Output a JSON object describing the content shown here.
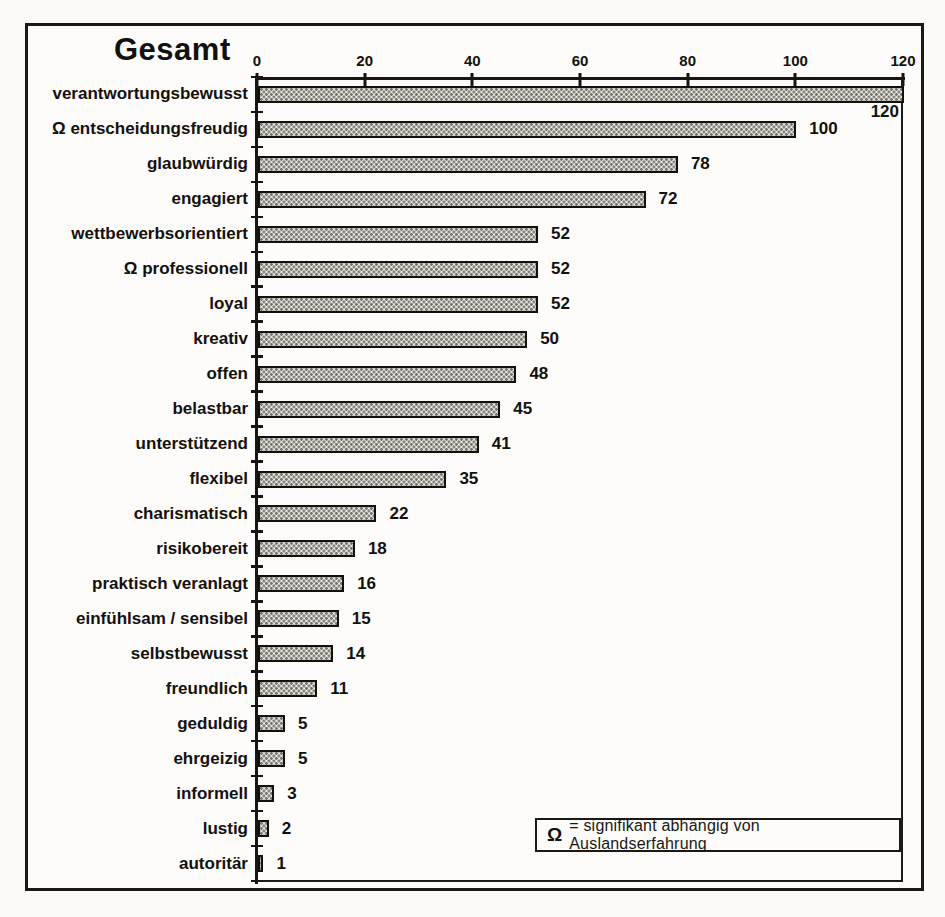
{
  "chart_data": {
    "type": "bar",
    "orientation": "horizontal",
    "title": "Gesamt",
    "categories": [
      "verantwortungsbewusst",
      "Ω entscheidungsfreudig",
      "glaubwürdig",
      "engagiert",
      "wettbewerbsorientiert",
      "Ω professionell",
      "loyal",
      "kreativ",
      "offen",
      "belastbar",
      "unterstützend",
      "flexibel",
      "charismatisch",
      "risikobereit",
      "praktisch veranlagt",
      "einfühlsam / sensibel",
      "selbstbewusst",
      "freundlich",
      "geduldig",
      "ehrgeizig",
      "informell",
      "lustig",
      "autoritär"
    ],
    "values": [
      120,
      100,
      78,
      72,
      52,
      52,
      52,
      50,
      48,
      45,
      41,
      35,
      22,
      18,
      16,
      15,
      14,
      11,
      5,
      5,
      3,
      2,
      1
    ],
    "xlim": [
      0,
      120
    ],
    "xticks": [
      0,
      20,
      40,
      60,
      80,
      100,
      120
    ],
    "grid": false,
    "bar_style": "halftone-dot-pattern",
    "legend_position": "bottom-right-inside",
    "legend": {
      "symbol": "Ω",
      "text": "= signifikant  abhängig von Auslandserfahrung"
    }
  }
}
